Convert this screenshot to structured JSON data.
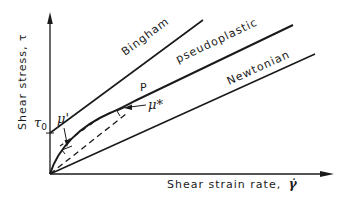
{
  "figure": {
    "type": "rheology-flow-curves",
    "background": "#ffffff",
    "ink_color": "#1a1a1a"
  },
  "axes": {
    "y_label": "Shear stress, τ",
    "x_label": "Shear strain rate, γ̇",
    "x_label_text": "Shear strain rate,",
    "x_label_symbol": "γ̇"
  },
  "curves": [
    {
      "name": "Bingham",
      "label": "Bingham",
      "shape": "straight line with intercept"
    },
    {
      "name": "pseudoplastic",
      "label": "pseudoplastic",
      "shape": "concave-down curve"
    },
    {
      "name": "Newtonian",
      "label": "Newtonian",
      "shape": "straight line through origin"
    }
  ],
  "annotations": {
    "yield_stress": "τ0",
    "yield_stress_main": "τ",
    "yield_stress_sub": "0",
    "point_label": "P",
    "tangent_viscosity": "μ'",
    "apparent_viscosity": "μ*"
  }
}
